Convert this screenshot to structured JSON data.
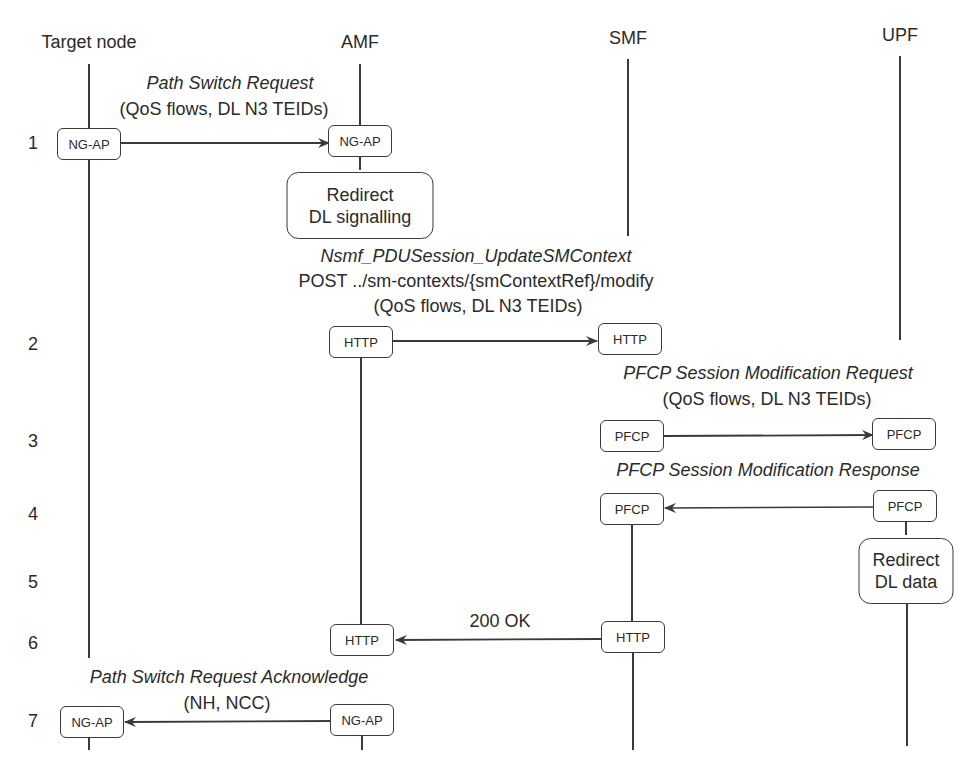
{
  "participants": [
    {
      "name": "Target node",
      "x": 89
    },
    {
      "name": "AMF",
      "x": 360
    },
    {
      "name": "SMF",
      "x": 628
    },
    {
      "name": "UPF",
      "x": 900
    }
  ],
  "steps": [
    {
      "number": "1"
    },
    {
      "number": "2"
    },
    {
      "number": "3"
    },
    {
      "number": "4"
    },
    {
      "number": "5"
    },
    {
      "number": "6"
    },
    {
      "number": "7"
    }
  ],
  "messages": {
    "m1": {
      "title": "Path Switch Request",
      "params": "(QoS flows, DL N3 TEIDs)",
      "from_box": "NG-AP",
      "to_box": "NG-AP"
    },
    "redirect_signalling": {
      "line1": "Redirect",
      "line2": "DL signalling"
    },
    "m2": {
      "title": "Nsmf_PDUSession_UpdateSMContext",
      "line2": "POST ../sm-contexts/{smContextRef}/modify",
      "params": "(QoS flows, DL N3 TEIDs)",
      "from_box": "HTTP",
      "to_box": "HTTP"
    },
    "m3": {
      "title": "PFCP Session Modification Request",
      "params": "(QoS flows, DL N3 TEIDs)",
      "from_box": "PFCP",
      "to_box": "PFCP"
    },
    "m4": {
      "title": "PFCP Session Modification Response",
      "from_box": "PFCP",
      "to_box": "PFCP"
    },
    "redirect_data": {
      "line1": "Redirect",
      "line2": "DL data"
    },
    "m6": {
      "title": "200 OK",
      "from_box": "HTTP",
      "to_box": "HTTP"
    },
    "m7": {
      "title": "Path Switch Request Acknowledge",
      "params": "(NH, NCC)",
      "from_box": "NG-AP",
      "to_box": "NG-AP"
    }
  },
  "colors": {
    "line": "#3a3a3a",
    "text": "#2a2a2a",
    "background": "#ffffff"
  }
}
